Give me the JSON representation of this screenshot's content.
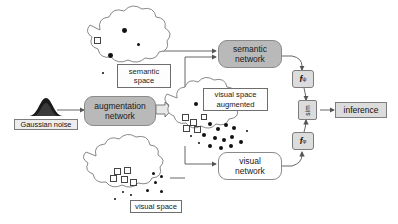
{
  "diagram": {
    "background": "#ffffff",
    "accent_gray": "#b9b9b9",
    "box_gray": "#dcdcdc",
    "line_color": "#555555"
  },
  "nodes": {
    "gaussian_noise_label": "Gaussian noise",
    "augmentation_network": {
      "line1": "augmentation",
      "line2": "network"
    },
    "semantic_network": {
      "line1": "semantic",
      "line2": "network"
    },
    "visual_network": {
      "line1": "visual",
      "line2": "network"
    },
    "semantic_space_label": {
      "line1": "semantic",
      "line2": "space"
    },
    "visual_space_augmented_label": {
      "line1": "visual space",
      "line2": "augmented"
    },
    "visual_space_label": "visual space",
    "f_psi": {
      "base": "f",
      "sub": "ψ"
    },
    "f_phi": {
      "base": "f",
      "sub": "φ"
    },
    "similarity": "sim",
    "inference": "inference"
  },
  "clouds": {
    "semantic_space": {
      "name": "semantic space",
      "dots": [
        {
          "x": 44,
          "y": 18,
          "r": 2.4
        },
        {
          "x": 30,
          "y": 43,
          "r": 2.4
        },
        {
          "x": 59,
          "y": 33,
          "r": 1.5
        },
        {
          "x": 57,
          "y": 58,
          "r": 2.0
        },
        {
          "x": 24,
          "y": 62,
          "r": 0.9
        }
      ],
      "squares": [
        {
          "x": 16,
          "y": 27,
          "s": 4.5
        }
      ]
    },
    "visual_space_augmented": {
      "name": "visual space augmented",
      "dots": [
        {
          "x": 22,
          "y": 10,
          "r": 2.2
        },
        {
          "x": 32,
          "y": 9,
          "r": 2.2
        },
        {
          "x": 48,
          "y": 14,
          "r": 2.2
        },
        {
          "x": 36,
          "y": 30,
          "r": 2.2
        },
        {
          "x": 44,
          "y": 35,
          "r": 2.2
        },
        {
          "x": 52,
          "y": 31,
          "r": 2.2
        },
        {
          "x": 60,
          "y": 34,
          "r": 2.2
        },
        {
          "x": 30,
          "y": 41,
          "r": 2.2
        },
        {
          "x": 41,
          "y": 44,
          "r": 2.2
        },
        {
          "x": 50,
          "y": 46,
          "r": 2.2
        },
        {
          "x": 58,
          "y": 43,
          "r": 2.2
        },
        {
          "x": 36,
          "y": 54,
          "r": 2.2
        },
        {
          "x": 47,
          "y": 57,
          "r": 2.2
        },
        {
          "x": 57,
          "y": 55,
          "r": 2.2
        },
        {
          "x": 67,
          "y": 50,
          "r": 2.2
        },
        {
          "x": 66,
          "y": 62,
          "r": 2.2
        },
        {
          "x": 26,
          "y": 55,
          "r": 1.1
        },
        {
          "x": 18,
          "y": 45,
          "r": 1.1
        },
        {
          "x": 74,
          "y": 40,
          "r": 1.1
        }
      ],
      "squares": [
        {
          "x": 10,
          "y": 22,
          "s": 4.5
        },
        {
          "x": 18,
          "y": 27,
          "s": 4.5
        },
        {
          "x": 11,
          "y": 33,
          "s": 4.5
        },
        {
          "x": 22,
          "y": 34,
          "s": 4.5
        },
        {
          "x": 29,
          "y": 22,
          "s": 3.5
        }
      ]
    },
    "visual_space": {
      "name": "visual space",
      "dots": [
        {
          "x": 58,
          "y": 24,
          "r": 1.6
        },
        {
          "x": 66,
          "y": 27,
          "r": 1.6
        },
        {
          "x": 60,
          "y": 33,
          "r": 1.6
        },
        {
          "x": 52,
          "y": 41,
          "r": 1.6
        },
        {
          "x": 66,
          "y": 42,
          "r": 1.6
        },
        {
          "x": 44,
          "y": 55,
          "r": 2.2
        },
        {
          "x": 53,
          "y": 58,
          "r": 2.2
        },
        {
          "x": 62,
          "y": 57,
          "r": 2.2
        },
        {
          "x": 70,
          "y": 54,
          "r": 2.2
        },
        {
          "x": 36,
          "y": 46,
          "r": 1.2
        },
        {
          "x": 28,
          "y": 43,
          "r": 1.2
        },
        {
          "x": 20,
          "y": 50,
          "r": 1.2
        }
      ],
      "squares": [
        {
          "x": 20,
          "y": 20,
          "s": 4.5
        },
        {
          "x": 30,
          "y": 19,
          "s": 4.5
        },
        {
          "x": 16,
          "y": 27,
          "s": 4.5
        },
        {
          "x": 27,
          "y": 28,
          "s": 4.5
        },
        {
          "x": 36,
          "y": 31,
          "s": 4.5
        }
      ]
    }
  },
  "connections": [
    {
      "from": "semantic_space",
      "to": "semantic_network"
    },
    {
      "from": "gaussian_noise",
      "to": "augmentation_network"
    },
    {
      "from": "augmentation_network",
      "to": "visual_space_augmented"
    },
    {
      "from": "visual_space_augmented",
      "to": "semantic_network"
    },
    {
      "from": "visual_space_augmented",
      "to": "visual_network"
    },
    {
      "from": "visual_space",
      "to": "visual_network"
    },
    {
      "from": "semantic_network",
      "to": "f_psi"
    },
    {
      "from": "visual_network",
      "to": "f_phi"
    },
    {
      "from": "f_psi",
      "to": "similarity"
    },
    {
      "from": "f_phi",
      "to": "similarity"
    },
    {
      "from": "similarity",
      "to": "inference"
    }
  ]
}
